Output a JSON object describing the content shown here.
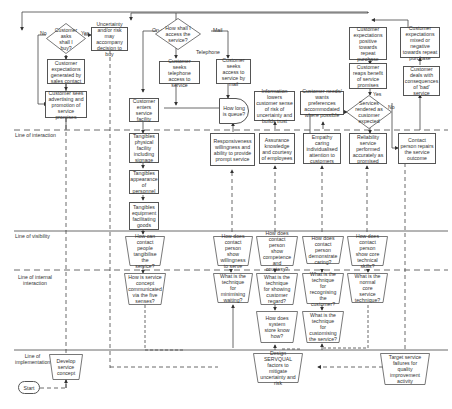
{
  "diagram": {
    "type": "service blueprint flowchart",
    "lanes": {
      "line_of_interaction": "Line of interaction",
      "line_of_visibility": "Line of visibility",
      "line_of_internal_interaction": "Line of internal interaction",
      "line_of_implementation": "Line of implementation"
    },
    "decisions": {
      "should_i_buy": "Customer asks shall I buy?",
      "how_access": "How shall I access the service?",
      "service_as_expected": "Services rendered as customer expected"
    },
    "edge_labels": {
      "no_left": "No",
      "yes_left": "Yes",
      "on_site": "On-site",
      "mail": "Mail",
      "telephone": "Telephone",
      "yes_right": "Yes",
      "no_right": "No"
    },
    "customer_actions": {
      "uncertainty": "Uncertainty and/or risk may accompany decision to buy",
      "expectations_sales": "Customer expectations generated by sales contact",
      "sees_advertising": "Customer sees advertising and promotion of service promises",
      "enters_facility": "Customer enters service facility",
      "telephone_access": "Customer seeks telephone access to service",
      "mail_access": "Customer seeks access to service by mail",
      "how_long_queue": "How long is queue?",
      "information_lowers": "Information lowers customer sense of risk of uncertainty and builds trust",
      "needs_accommodated": "Customer needs/ wants preferences accommodated where possible",
      "reaps_benefit": "Customer reaps benefit of service promises",
      "expectations_positive": "Customer expectations positive towards repeat purchase",
      "expectations_mixed": "Customer expectations mixed or negative towards repeat purchase",
      "deals_bad_service": "Customer deals with consequences of 'bad' service"
    },
    "onstage": {
      "tangibles_facility": "Tangibles physical facility including signage",
      "tangibles_personnel": "Tangibles appearance of personnel",
      "tangibles_equipment": "Tangibles equipment facilitating goods",
      "responsiveness": "Responsiveness willingness and ability to provide prompt service",
      "assurance": "Assurance knowledge and courtesy of employees",
      "empathy": "Empathy caring individualised attention to customers",
      "reliability": "Reliability service performed accurately as promised",
      "contact_repairs": "Contact person repairs the service outcome"
    },
    "backstage": {
      "contact_tangibles": "How can contact people tangibilise the service?",
      "show_willingness": "How does contact person show willingness to serve",
      "show_competence": "How does contact person show competence and courtesy?",
      "demonstrate_caring": "How does contact person demonstrate caring?",
      "core_technical": "How does contact person show core technical skills?"
    },
    "support": {
      "concept_five_senses": "How is service concept communicated via the five senses?",
      "minimising_waiting": "What is the technique for minimising waiting?",
      "showing_regard": "What is the technique for showing customer regard?",
      "recognising_customer": "What is the technique for recognising the customer?",
      "normal_core": "What is the normal core service technique?",
      "system_know_how": "How does system store know how?",
      "customising": "What is the technique for customising the service?"
    },
    "implementation": {
      "develop_concept": "Develop service concept",
      "design_servqual": "Design SERVQUAL factors to mitigate uncertainty and risk",
      "target_failures": "Target service failures for quality improvement activity",
      "start": "Start"
    },
    "colors": {
      "line": "#444444",
      "box_border": "#555555",
      "text": "#333333",
      "background": "#ffffff"
    }
  }
}
